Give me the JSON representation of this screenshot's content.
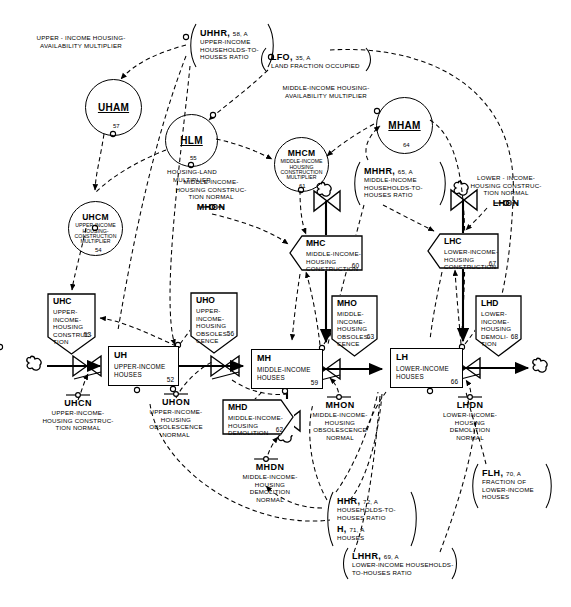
{
  "diagram": {
    "colors": {
      "ink": "#000000",
      "paper": "#ffffff"
    }
  },
  "circles": [
    {
      "id": "uham",
      "abbr": "UHAM",
      "underline": true,
      "number": "57",
      "sub": "",
      "x": 85,
      "y": 79,
      "d": 57,
      "caption": "UPPER-INCOME HOUSING-\nAVAILABILITY MULTIPLIER"
    },
    {
      "id": "hlm",
      "abbr": "HLM",
      "underline": true,
      "number": "55",
      "sub": "",
      "x": 165,
      "y": 114,
      "d": 53,
      "caption": "HOUSING-LAND\nMULTIPLIER"
    },
    {
      "id": "mham",
      "abbr": "MHAM",
      "underline": true,
      "number": "64",
      "sub": "",
      "x": 376,
      "y": 97,
      "d": 57,
      "caption": "MIDDLE-INCOME HOUSING-\nAVAILABILITY MULTIPLIER"
    },
    {
      "id": "mhcm",
      "abbr": "MHCM",
      "underline": false,
      "number": "61",
      "sub": "MIDDLE-INCOME\nHOUSING\nCONSTRUCTION\nMULTIPLIER",
      "x": 274,
      "y": 137,
      "d": 55,
      "caption": ""
    },
    {
      "id": "uhcm",
      "abbr": "UHCM",
      "underline": false,
      "number": "54",
      "sub": "UPPER-INCOME\nHOUSING-\nCONSTRUCTION\nMULTIPLIER",
      "x": 68,
      "y": 201,
      "d": 55,
      "caption": ""
    }
  ],
  "levels": [
    {
      "id": "uh",
      "abbr": "UH",
      "desc": "UPPER-INCOME\nHOUSES",
      "number": "52",
      "x": 108,
      "y": 346,
      "w": 71,
      "h": 40
    },
    {
      "id": "mh",
      "abbr": "MH",
      "desc": "MIDDLE-INCOME\nHOUSES",
      "number": "59",
      "x": 251,
      "y": 349,
      "w": 72,
      "h": 40
    },
    {
      "id": "lh",
      "abbr": "LH",
      "desc": "LOWER-INCOME\nHOUSES",
      "number": "66",
      "x": 390,
      "y": 348,
      "w": 73,
      "h": 40
    }
  ],
  "rates": [
    {
      "id": "uhc",
      "abbr": "UHC",
      "desc": "UPPER-\nINCOME-\nHOUSING\nCONSTRUC-\nTION",
      "number": "53",
      "x": 47,
      "y": 293,
      "w": 49,
      "h": 62
    },
    {
      "id": "uho",
      "abbr": "UHO",
      "desc": "UPPER-\nINCOME-\nHOUSING\nOBSOLES-\nCENCE",
      "number": "56",
      "x": 190,
      "y": 292,
      "w": 48,
      "h": 62
    },
    {
      "id": "mhc",
      "abbr": "MHC",
      "desc": "MIDDLE-INCOME-\nHOUSING\nCONSTRUCTION",
      "number": "60",
      "x": 289,
      "y": 235,
      "w": 74,
      "h": 36
    },
    {
      "id": "mho",
      "abbr": "MHO",
      "desc": "MIDDLE-\nINCOME-\nHOUSING\nOBSOLES-\nCENCE",
      "number": "63",
      "x": 331,
      "y": 295,
      "w": 47,
      "h": 62
    },
    {
      "id": "mhd",
      "abbr": "MHD",
      "desc": "MIDDLE-INCOME-\nHOUSING\nDEMOLITION",
      "number": "62",
      "x": 222,
      "y": 399,
      "w": 72,
      "h": 36
    },
    {
      "id": "lhc",
      "abbr": "LHC",
      "desc": "LOWER-INCOME-\nHOUSING\nCONSTRUCTION",
      "number": "67",
      "x": 427,
      "y": 233,
      "w": 72,
      "h": 36
    },
    {
      "id": "lhd",
      "abbr": "LHD",
      "desc": "LOWER-\nINCOME-\nHOUSING\nDEMOLI-\nTION",
      "number": "68",
      "x": 475,
      "y": 295,
      "w": 47,
      "h": 62
    }
  ],
  "constants": [
    {
      "id": "mhcn",
      "abbr": "MHCN",
      "caption": "MIDDLE-INCOME-\nHOUSING CONSTRUC-\nTION NORMAL",
      "x": 163,
      "y": 196,
      "w": 96,
      "above": true
    },
    {
      "id": "lhcn",
      "abbr": "LHCN",
      "caption": "LOWER - INCOME-\nHOUSING CONSTRUC-\nTION NORMAL",
      "x": 458,
      "y": 192,
      "w": 96,
      "above": true
    },
    {
      "id": "uhcn",
      "abbr": "UHCN",
      "caption": "UPPER-INCOME-\nHOUSING CONSTRUC-\nTION NORMAL",
      "x": 28,
      "y": 404,
      "w": 96,
      "above": false
    },
    {
      "id": "uhon",
      "abbr": "UHON",
      "caption": "UPPER-INCOME-\nHOUSING\nOBSOLESCENCE\nNORMAL",
      "x": 136,
      "y": 400,
      "w": 80,
      "above": false
    },
    {
      "id": "mhdn",
      "abbr": "MHDN",
      "caption": "MIDDLE-INCOME-\nHOUSING\nDEMOLITION\nNORMAL",
      "x": 229,
      "y": 465,
      "w": 84,
      "above": false
    },
    {
      "id": "mhon",
      "abbr": "MHON",
      "caption": "MIDDLE-INCOME-\nHOUSING\nOBSOLESCENCE\nNORMAL",
      "x": 316,
      "y": 402,
      "w": 84,
      "above": false
    },
    {
      "id": "lhdn",
      "abbr": "LHDN",
      "caption": "LOWER-INCOME-\nHOUSING\nDEMOLITION\nNORMAL",
      "x": 446,
      "y": 402,
      "w": 84,
      "above": false
    }
  ],
  "brackets": [
    {
      "id": "uhhr",
      "abbr": "UHHR",
      "meta": "58, A",
      "body": "UPPER-INCOME\nHOUSEHOLDS-TO-\nHOUSES RATIO",
      "x": 188,
      "y": 24,
      "w": 86,
      "h": 42
    },
    {
      "id": "lfo",
      "abbr": "LFO",
      "meta": "35, A",
      "body": "LAND FRACTION OCCUPIED",
      "x": 258,
      "y": 49,
      "w": 106,
      "h": 20
    },
    {
      "id": "mhhr",
      "abbr": "MHHR",
      "meta": "65, A",
      "body": "MIDDLE-INCOME\nHOUSEHOLDS-TO-\nHOUSES RATIO",
      "x": 352,
      "y": 162,
      "w": 90,
      "h": 42
    },
    {
      "id": "hhr",
      "abbr": "HHR",
      "meta": "72, A",
      "body": "HOUSEHOLDS-TO-\nHOUSES RATIO",
      "x": 325,
      "y": 494,
      "w": 88,
      "h": 30
    },
    {
      "id": "h",
      "abbr": "H",
      "meta": "71, A",
      "body": "HOUSES",
      "x": 325,
      "y": 523,
      "w": 88,
      "h": 20
    },
    {
      "id": "lhhr",
      "abbr": "LHHR",
      "meta": "69, A",
      "body": "LOWER-INCOME HOUSEHOLDS-\nTO-HOUSES RATIO",
      "x": 341,
      "y": 548,
      "w": 112,
      "h": 30
    },
    {
      "id": "flh",
      "abbr": "FLH",
      "meta": "70, A",
      "body": "FRACTION OF\nLOWER-INCOME\nHOUSES",
      "x": 471,
      "y": 466,
      "w": 74,
      "h": 40
    }
  ]
}
